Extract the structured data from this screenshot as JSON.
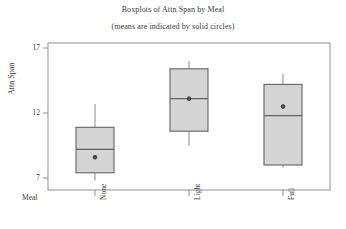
{
  "chart_data": {
    "type": "box",
    "title": "Boxplots of Attn Span by Meal",
    "subtitle": "(means are indicated by solid circles)",
    "xlabel": "Meal",
    "ylabel": "Attn Span",
    "categories": [
      "None",
      "Light",
      "Full"
    ],
    "ylim": [
      6.4,
      17.3
    ],
    "yticks": [
      7,
      12,
      17
    ],
    "ytick_labels": [
      "7",
      "12",
      "17"
    ],
    "grid": false,
    "legend": null,
    "boxes": [
      {
        "category": "None",
        "whisker_low": 6.8,
        "q1": 7.4,
        "median": 9.2,
        "q3": 10.9,
        "whisker_high": 12.7,
        "mean": 8.6
      },
      {
        "category": "Light",
        "whisker_low": 9.5,
        "q1": 10.6,
        "median": 13.1,
        "q3": 15.4,
        "whisker_high": 16.0,
        "mean": 13.1
      },
      {
        "category": "Full",
        "whisker_low": 7.8,
        "q1": 8.0,
        "median": 11.8,
        "q3": 14.2,
        "whisker_high": 15.0,
        "mean": 12.5
      }
    ],
    "style": {
      "box_fill": "#d4d4d4",
      "box_stroke": "#636363",
      "whisker_color": "#8a8a8a",
      "mean_marker_color": "#4a4a4a",
      "frame_color": "#8f8f8f",
      "text_color": "#3a3a3a"
    }
  }
}
